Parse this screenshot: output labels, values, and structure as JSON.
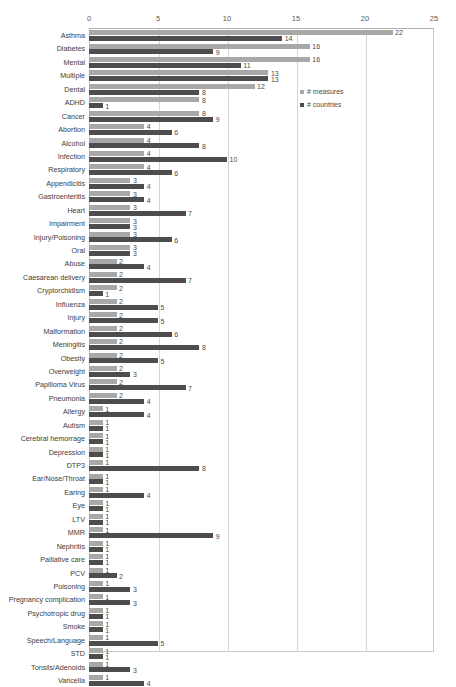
{
  "chart_data": {
    "type": "bar",
    "orientation": "horizontal",
    "title": "",
    "xlabel": "",
    "ylabel": "",
    "xlim": [
      0,
      25
    ],
    "xticks": [
      0,
      5,
      10,
      15,
      20,
      25
    ],
    "grid": true,
    "legend_position": "right",
    "colors": {
      "measures": "#a8a8a8",
      "countries": "#4d4d4d",
      "gridline": "#d6d6d6",
      "plot_border": "#c9c9c9"
    },
    "series": [
      {
        "name": "# measures",
        "color": "#a8a8a8"
      },
      {
        "name": "# countries",
        "color": "#4d4d4d"
      }
    ],
    "categories": [
      "Asthma",
      "Diabetes",
      "Mental",
      "Multiple",
      "Dental",
      "ADHD",
      "Cancer",
      "Abortion",
      "Alcohol",
      "Infection",
      "Respiratory",
      "Appendicitis",
      "Gastroenteritis",
      "Heart",
      "Impairment",
      "Injury/Poisoning",
      "Oral",
      "Abuse",
      "Caesarean delivery",
      "Cryptorchidism",
      "Influenza",
      "Injury",
      "Malformation",
      "Meningitis",
      "Obesity",
      "Overweight",
      "Papilloma Virus",
      "Pneumonia",
      "Allergy",
      "Autism",
      "Cerebral hemorrage",
      "Depression",
      "DTP3",
      "Ear/Nose/Throat",
      "Earing",
      "Eye",
      "LTV",
      "MMR",
      "Nephritis",
      "Palliative care",
      "PCV",
      "Poisoning",
      "Pregnancy complication",
      "Psychotropic drug",
      "Smoke",
      "Speech/Language",
      "STD",
      "Tonsils/Adenoids",
      "Varicella"
    ],
    "rows": [
      {
        "label": "Asthma",
        "measures": 22,
        "countries": 14
      },
      {
        "label": "Diabetes",
        "measures": 16,
        "countries": 9
      },
      {
        "label": "Mental",
        "measures": 16,
        "countries": 11
      },
      {
        "label": "Multiple",
        "measures": 13,
        "countries": 13
      },
      {
        "label": "Dental",
        "measures": 12,
        "countries": 8
      },
      {
        "label": "ADHD",
        "measures": 8,
        "countries": 1
      },
      {
        "label": "Cancer",
        "measures": 8,
        "countries": 9
      },
      {
        "label": "Abortion",
        "measures": 4,
        "countries": 6
      },
      {
        "label": "Alcohol",
        "measures": 4,
        "countries": 8
      },
      {
        "label": "Infection",
        "measures": 4,
        "countries": 10
      },
      {
        "label": "Respiratory",
        "measures": 4,
        "countries": 6
      },
      {
        "label": "Appendicitis",
        "measures": 3,
        "countries": 4
      },
      {
        "label": "Gastroenteritis",
        "measures": 3,
        "countries": 4
      },
      {
        "label": "Heart",
        "measures": 3,
        "countries": 7
      },
      {
        "label": "Impairment",
        "measures": 3,
        "countries": 3
      },
      {
        "label": "Injury/Poisoning",
        "measures": 3,
        "countries": 6
      },
      {
        "label": "Oral",
        "measures": 3,
        "countries": 3
      },
      {
        "label": "Abuse",
        "measures": 2,
        "countries": 4
      },
      {
        "label": "Caesarean delivery",
        "measures": 2,
        "countries": 7
      },
      {
        "label": "Cryptorchidism",
        "measures": 2,
        "countries": 1
      },
      {
        "label": "Influenza",
        "measures": 2,
        "countries": 5
      },
      {
        "label": "Injury",
        "measures": 2,
        "countries": 5
      },
      {
        "label": "Malformation",
        "measures": 2,
        "countries": 6
      },
      {
        "label": "Meningitis",
        "measures": 2,
        "countries": 8
      },
      {
        "label": "Obesity",
        "measures": 2,
        "countries": 5
      },
      {
        "label": "Overweight",
        "measures": 2,
        "countries": 3
      },
      {
        "label": "Papilloma Virus",
        "measures": 2,
        "countries": 7
      },
      {
        "label": "Pneumonia",
        "measures": 2,
        "countries": 4
      },
      {
        "label": "Allergy",
        "measures": 1,
        "countries": 4
      },
      {
        "label": "Autism",
        "measures": 1,
        "countries": 1
      },
      {
        "label": "Cerebral hemorrage",
        "measures": 1,
        "countries": 1
      },
      {
        "label": "Depression",
        "measures": 1,
        "countries": 1
      },
      {
        "label": "DTP3",
        "measures": 1,
        "countries": 8
      },
      {
        "label": "Ear/Nose/Throat",
        "measures": 1,
        "countries": 1
      },
      {
        "label": "Earing",
        "measures": 1,
        "countries": 4
      },
      {
        "label": "Eye",
        "measures": 1,
        "countries": 1
      },
      {
        "label": "LTV",
        "measures": 1,
        "countries": 1
      },
      {
        "label": "MMR",
        "measures": 1,
        "countries": 9
      },
      {
        "label": "Nephritis",
        "measures": 1,
        "countries": 1
      },
      {
        "label": "Palliative care",
        "measures": 1,
        "countries": 1
      },
      {
        "label": "PCV",
        "measures": 1,
        "countries": 2
      },
      {
        "label": "Poisoning",
        "measures": 1,
        "countries": 3
      },
      {
        "label": "Pregnancy complication",
        "measures": 1,
        "countries": 3
      },
      {
        "label": "Psychotropic drug",
        "measures": 1,
        "countries": 1
      },
      {
        "label": "Smoke",
        "measures": 1,
        "countries": 1
      },
      {
        "label": "Speech/Language",
        "measures": 1,
        "countries": 5
      },
      {
        "label": "STD",
        "measures": 1,
        "countries": 1
      },
      {
        "label": "Tonsils/Adenoids",
        "measures": 1,
        "countries": 3
      },
      {
        "label": "Varicella",
        "measures": 1,
        "countries": 4
      }
    ]
  }
}
